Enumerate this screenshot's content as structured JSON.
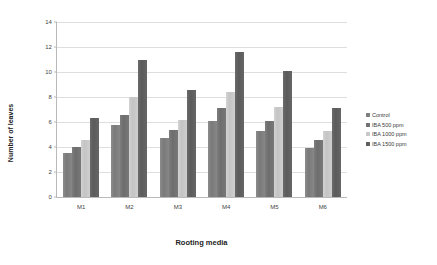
{
  "chart_data": {
    "type": "bar",
    "title": "",
    "xlabel": "Rooting media",
    "ylabel": "Number of leaves",
    "categories": [
      "M1",
      "M2",
      "M3",
      "M4",
      "M5",
      "M6"
    ],
    "series": [
      {
        "name": "Control",
        "color": "#808080",
        "values": [
          3.5,
          5.8,
          4.7,
          6.1,
          5.3,
          3.9
        ]
      },
      {
        "name": "IBA 500 ppm",
        "color": "#757575",
        "values": [
          4.0,
          6.6,
          5.4,
          7.1,
          6.1,
          4.6
        ]
      },
      {
        "name": "IBA 1000 ppm",
        "color": "#cccccc",
        "values": [
          4.6,
          8.0,
          6.2,
          8.4,
          7.2,
          5.3
        ]
      },
      {
        "name": "IBA 1500 ppm",
        "color": "#636363",
        "values": [
          6.3,
          11.0,
          8.6,
          11.6,
          10.1,
          7.1
        ]
      }
    ],
    "ylim": [
      0,
      14
    ],
    "yticks": [
      0,
      2,
      4,
      6,
      8,
      10,
      12,
      14
    ],
    "grid": true,
    "legend_position": "right"
  }
}
